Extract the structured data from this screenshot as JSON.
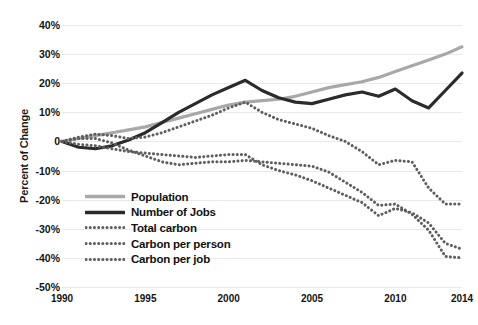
{
  "chart_data": {
    "type": "line",
    "title": "",
    "xlabel": "",
    "ylabel": "Percent of Change",
    "x": [
      1990,
      1991,
      1992,
      1993,
      1994,
      1995,
      1996,
      1997,
      1998,
      1999,
      2000,
      2001,
      2002,
      2003,
      2004,
      2005,
      2006,
      2007,
      2008,
      2009,
      2010,
      2011,
      2012,
      2013,
      2014
    ],
    "xlim": [
      1990,
      2014
    ],
    "ylim": [
      -50,
      40
    ],
    "xticks": [
      "1990",
      "1995",
      "2000",
      "2005",
      "2010",
      "2014"
    ],
    "xtick_values": [
      1990,
      1995,
      2000,
      2005,
      2010,
      2014
    ],
    "yticks": [
      "40%",
      "30%",
      "20%",
      "10%",
      "0",
      "-10%",
      "-20%",
      "-30%",
      "-40%",
      "-50%"
    ],
    "ytick_values": [
      40,
      30,
      20,
      10,
      0,
      -10,
      -20,
      -30,
      -40,
      -50
    ],
    "grid": true,
    "legend_position": "lower-left-inside",
    "series": [
      {
        "name": "Population",
        "style": "solid",
        "color": "#a8a8a8",
        "width": 3.2,
        "values": [
          0,
          1,
          2,
          3,
          4,
          5,
          6.5,
          8,
          9.5,
          11,
          12.5,
          13.5,
          14,
          14.5,
          15.5,
          17,
          18.5,
          19.5,
          20.5,
          22,
          24,
          26,
          28,
          30,
          32.5
        ]
      },
      {
        "name": "Number of Jobs",
        "style": "solid",
        "color": "#2b2b2b",
        "width": 3.2,
        "values": [
          0,
          -2,
          -2.5,
          -1.5,
          0.5,
          3,
          6.5,
          10,
          13,
          16,
          18.5,
          21,
          17.5,
          15,
          13.5,
          13,
          14.5,
          16,
          17,
          15.5,
          18,
          14,
          11.5,
          17.5,
          23.5
        ]
      },
      {
        "name": "Total carbon",
        "style": "dotted",
        "color": "#5e5e5e",
        "width": 3.0,
        "values": [
          0,
          1.5,
          2.5,
          2,
          1,
          1.5,
          3,
          5,
          7,
          9,
          11.5,
          13.5,
          10,
          7.5,
          6,
          4.5,
          2,
          0,
          -3.5,
          -8,
          -6.5,
          -7,
          -16,
          -21.5,
          -21.5
        ]
      },
      {
        "name": "Carbon per person",
        "style": "dotted",
        "color": "#5e5e5e",
        "width": 3.0,
        "values": [
          0,
          -1,
          -1.5,
          -2.5,
          -3.5,
          -4,
          -4.5,
          -5,
          -5.5,
          -5,
          -4.5,
          -4.5,
          -8,
          -10,
          -11.5,
          -13.5,
          -16,
          -18.5,
          -21,
          -25.5,
          -23,
          -24.5,
          -28,
          -35,
          -37
        ]
      },
      {
        "name": "Carbon per job",
        "style": "dotted",
        "color": "#5e5e5e",
        "width": 3.0,
        "values": [
          0,
          1,
          1,
          -0.5,
          -3,
          -5,
          -7,
          -8,
          -7.5,
          -7,
          -7,
          -6.5,
          -7,
          -7.5,
          -8,
          -8.5,
          -10.5,
          -14,
          -17.5,
          -22,
          -21.5,
          -25,
          -30.5,
          -39.5,
          -40
        ]
      }
    ]
  },
  "axes": {
    "y_title": "Percent of Change"
  },
  "legend": {
    "items": [
      {
        "label": "Population",
        "style": "solid",
        "color": "#a8a8a8"
      },
      {
        "label": "Number of Jobs",
        "style": "solid",
        "color": "#2b2b2b"
      },
      {
        "label": "Total carbon",
        "style": "dotted",
        "color": "#5e5e5e"
      },
      {
        "label": "Carbon per person",
        "style": "dotted",
        "color": "#5e5e5e"
      },
      {
        "label": "Carbon per job",
        "style": "dotted",
        "color": "#5e5e5e"
      }
    ]
  }
}
